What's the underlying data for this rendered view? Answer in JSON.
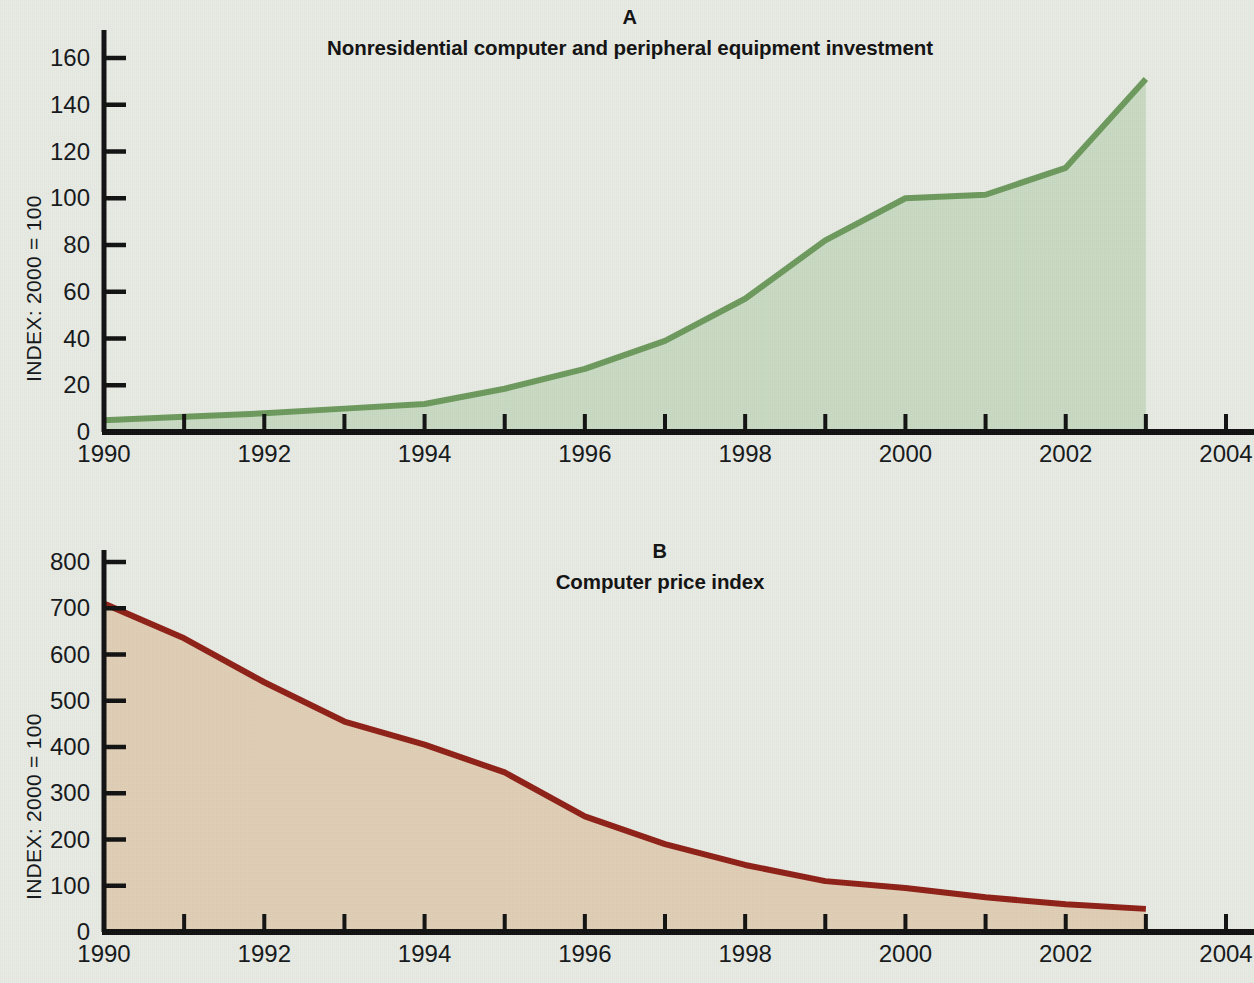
{
  "figure": {
    "background_color": "#e8eae4",
    "panels": [
      {
        "letter": "A",
        "subtitle": "Nonresidential computer and peripheral equipment investment",
        "y_axis_title": "INDEX: 2000 = 100"
      },
      {
        "letter": "B",
        "subtitle": "Computer price index",
        "y_axis_title": "INDEX: 2000 = 100"
      }
    ]
  },
  "chart_data": [
    {
      "type": "area",
      "panel": "A",
      "title": "Nonresidential computer and peripheral equipment investment",
      "xlabel": "",
      "ylabel": "INDEX: 2000 = 100",
      "line_color": "#6d9a5d",
      "fill_color": "#c8dac2",
      "xlim": [
        1990,
        2004
      ],
      "ylim": [
        0,
        170
      ],
      "ytick_labels": [
        "0",
        "20",
        "40",
        "60",
        "80",
        "100",
        "120",
        "140",
        "160"
      ],
      "ytick_values": [
        0,
        20,
        40,
        60,
        80,
        100,
        120,
        140,
        160
      ],
      "xtick_labels": [
        "1990",
        "1992",
        "1994",
        "1996",
        "1998",
        "2000",
        "2002",
        "2004"
      ],
      "xtick_values": [
        1990,
        1992,
        1994,
        1996,
        1998,
        2000,
        2002,
        2004
      ],
      "minor_xticks": [
        1991,
        1993,
        1995,
        1997,
        1999,
        2001,
        2003
      ],
      "grid": false,
      "legend": "none",
      "x": [
        1990,
        1991,
        1992,
        1993,
        1994,
        1995,
        1996,
        1997,
        1998,
        1999,
        2000,
        2001,
        2002,
        2003
      ],
      "values": [
        5,
        6.5,
        8,
        10,
        12,
        18.5,
        27,
        39,
        57,
        82,
        100,
        101.5,
        113,
        151
      ]
    },
    {
      "type": "area",
      "panel": "B",
      "title": "Computer price index",
      "xlabel": "",
      "ylabel": "INDEX: 2000 = 100",
      "line_color": "#8f2017",
      "fill_color": "#e0ceb5",
      "xlim": [
        1990,
        2004
      ],
      "ylim": [
        0,
        830
      ],
      "ytick_labels": [
        "0",
        "100",
        "200",
        "300",
        "400",
        "500",
        "600",
        "700",
        "800"
      ],
      "ytick_values": [
        0,
        100,
        200,
        300,
        400,
        500,
        600,
        700,
        800
      ],
      "xtick_labels": [
        "1990",
        "1992",
        "1994",
        "1996",
        "1998",
        "2000",
        "2002",
        "2004"
      ],
      "xtick_values": [
        1990,
        1992,
        1994,
        1996,
        1998,
        2000,
        2002,
        2004
      ],
      "minor_xticks": [
        1991,
        1993,
        1995,
        1997,
        1999,
        2001,
        2003
      ],
      "grid": false,
      "legend": "none",
      "x": [
        1990,
        1991,
        1992,
        1993,
        1994,
        1995,
        1996,
        1997,
        1998,
        1999,
        2000,
        2001,
        2002,
        2003
      ],
      "values": [
        710,
        635,
        540,
        455,
        405,
        345,
        250,
        190,
        145,
        110,
        95,
        75,
        60,
        50
      ]
    }
  ]
}
